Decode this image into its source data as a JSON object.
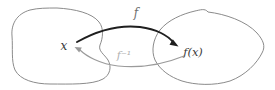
{
  "diagram": {
    "labels": {
      "domain_point": "x",
      "codomain_point": "f(x)",
      "forward_map": "f",
      "inverse_map": "f⁻¹"
    },
    "colors": {
      "background": "#ffffff",
      "set_outline": "#8b8b8b",
      "forward_arrow": "#1f1f1f",
      "inverse_arrow": "#9b9b9b",
      "label_dark": "#3a3a3a",
      "label_mid": "#6f6f6f",
      "label_light": "#b0b0b0"
    }
  }
}
